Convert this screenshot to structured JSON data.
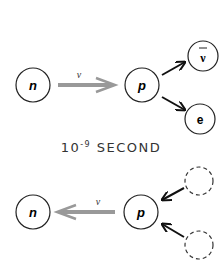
{
  "diagram": {
    "top": {
      "nodes": [
        {
          "id": "n",
          "label": "n",
          "style": "solid"
        },
        {
          "id": "p",
          "label": "p",
          "style": "solid"
        },
        {
          "id": "antineutrino",
          "label": "ν",
          "overbar": true,
          "style": "solid"
        },
        {
          "id": "electron",
          "label": "e",
          "style": "solid"
        }
      ],
      "arrow_label": "v",
      "arrows": [
        {
          "from": "n",
          "to": "p",
          "style": "gray-hollow"
        },
        {
          "from": "p",
          "to": "antineutrino",
          "style": "black"
        },
        {
          "from": "p",
          "to": "electron",
          "style": "black"
        }
      ]
    },
    "caption": {
      "base": "10",
      "exponent": "-9",
      "unit": "SECOND"
    },
    "bottom": {
      "nodes": [
        {
          "id": "n",
          "label": "n",
          "style": "solid"
        },
        {
          "id": "p",
          "label": "p",
          "style": "solid"
        },
        {
          "id": "ghost1",
          "label": "",
          "style": "dashed"
        },
        {
          "id": "ghost2",
          "label": "",
          "style": "dashed"
        }
      ],
      "arrow_label": "v",
      "arrows": [
        {
          "from": "p",
          "to": "n",
          "style": "gray-hollow"
        },
        {
          "from": "ghost1",
          "to": "p",
          "style": "black"
        },
        {
          "from": "ghost2",
          "to": "p",
          "style": "black"
        }
      ]
    }
  }
}
